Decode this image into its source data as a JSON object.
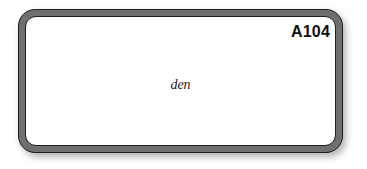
{
  "card": {
    "id_label": "A104",
    "word": "den",
    "colors": {
      "border_fill": "#6f6f6f",
      "border_line": "#1e1e1e",
      "background": "#ffffff",
      "text": "#111111"
    }
  }
}
